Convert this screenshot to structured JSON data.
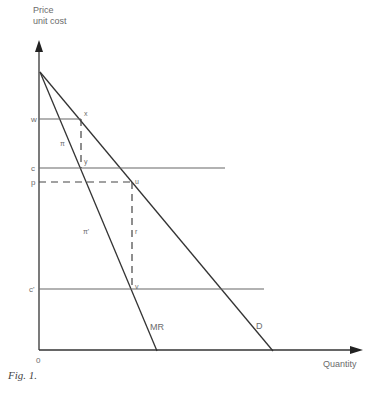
{
  "axes": {
    "y_label_line1": "Price",
    "y_label_line2": "unit cost",
    "x_label": "Quantity",
    "origin_label": "0"
  },
  "price_levels": {
    "w": "w",
    "c": "c",
    "p": "p",
    "c_prime": "c'"
  },
  "points": {
    "x": "x",
    "y": "y",
    "u": "u",
    "v": "v"
  },
  "regions": {
    "pi": "π",
    "pi_prime": "π'",
    "r": "r"
  },
  "curves": {
    "marginal_revenue": "MR",
    "demand": "D"
  },
  "caption": "Fig. 1."
}
